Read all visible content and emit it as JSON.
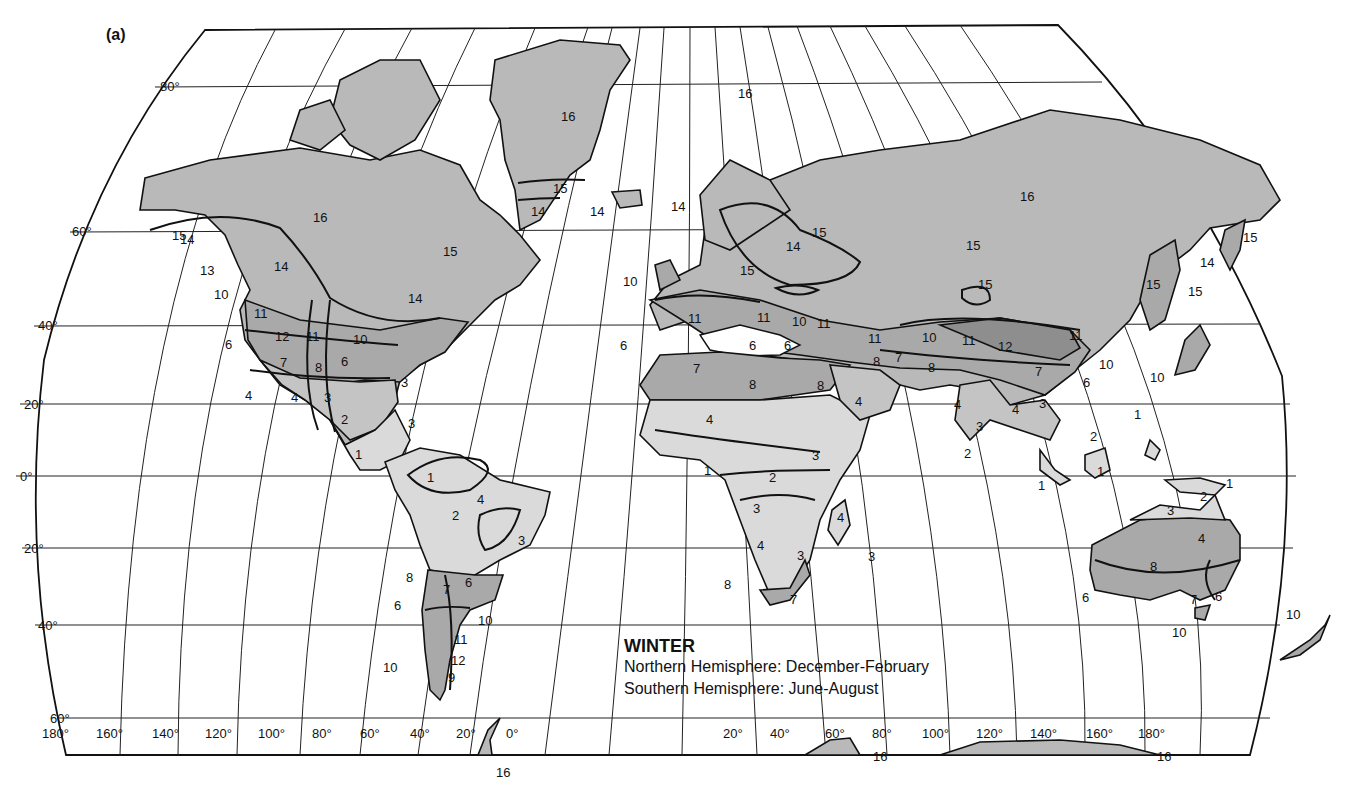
{
  "figure": {
    "panel_label": "(a)",
    "legend": {
      "title": "WINTER",
      "lines": [
        "Northern Hemisphere: December-February",
        "Southern Hemisphere: June-August"
      ]
    }
  },
  "axes": {
    "latitude_labels": [
      "80°",
      "60°",
      "40°",
      "20°",
      "0°",
      "20°",
      "40°",
      "60°"
    ],
    "longitude_labels": [
      "180°",
      "160°",
      "140°",
      "120°",
      "100°",
      "80°",
      "60°",
      "40°",
      "20°",
      "0°",
      "20°",
      "40°",
      "60°",
      "80°",
      "100°",
      "120°",
      "140°",
      "160°",
      "180°"
    ]
  },
  "colors": {
    "frame": "#111111",
    "land_zone_low": "#dadada",
    "land_zone_mid": "#c4c4c4",
    "land_zone_high": "#a9a9a9",
    "land_zone_dark": "#8e8e8e",
    "land_polar": "#b9b9b9"
  },
  "zone_labels": {
    "north_america": [
      "16",
      "15",
      "14",
      "15",
      "14",
      "13",
      "10",
      "14",
      "11",
      "12",
      "11",
      "10",
      "6",
      "7",
      "8",
      "6",
      "4",
      "4",
      "3",
      "3",
      "3",
      "2",
      "1"
    ],
    "greenland": [
      "16",
      "15",
      "14",
      "14"
    ],
    "south_america": [
      "1",
      "2",
      "4",
      "3",
      "8",
      "7",
      "6",
      "6",
      "10",
      "11",
      "12",
      "10",
      "9"
    ],
    "europe": [
      "14",
      "10",
      "15",
      "14",
      "15",
      "11",
      "6",
      "6",
      "6",
      "11",
      "10",
      "11"
    ],
    "africa": [
      "7",
      "8",
      "4",
      "3",
      "1",
      "2",
      "3",
      "4",
      "3",
      "8",
      "7",
      "4",
      "3"
    ],
    "asia": [
      "16",
      "16",
      "15",
      "15",
      "11",
      "10",
      "11",
      "12",
      "11",
      "10",
      "7",
      "8",
      "8",
      "8",
      "7",
      "6",
      "4",
      "4",
      "4",
      "3",
      "3",
      "2",
      "2",
      "1",
      "1",
      "1",
      "15",
      "15",
      "14",
      "15",
      "10"
    ],
    "oceania": [
      "1",
      "2",
      "3",
      "4",
      "8",
      "6",
      "7",
      "6",
      "10",
      "10"
    ],
    "antarctica": [
      "16",
      "16",
      "16"
    ]
  }
}
